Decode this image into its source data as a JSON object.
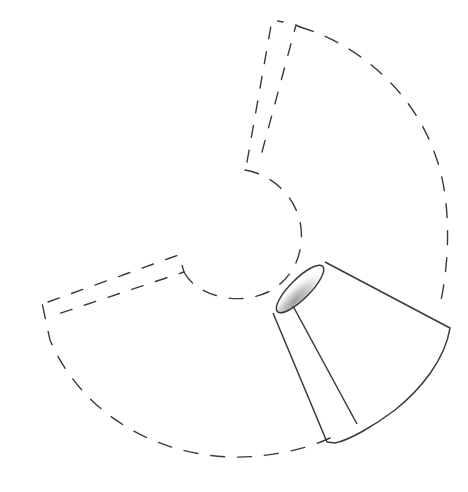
{
  "diagram": {
    "title": "",
    "colors": {
      "background": "#ffffff",
      "stroke": "#3a3a3a",
      "inner_shading": "#bdbdbd"
    },
    "elements": [
      {
        "name": "outer-arc",
        "style": "dashed"
      },
      {
        "name": "inner-arc",
        "style": "dashed"
      },
      {
        "name": "top-seam-tab",
        "style": "dashed"
      },
      {
        "name": "left-seam-tab",
        "style": "dashed"
      },
      {
        "name": "assembled-lampshade",
        "style": "solid"
      }
    ]
  }
}
